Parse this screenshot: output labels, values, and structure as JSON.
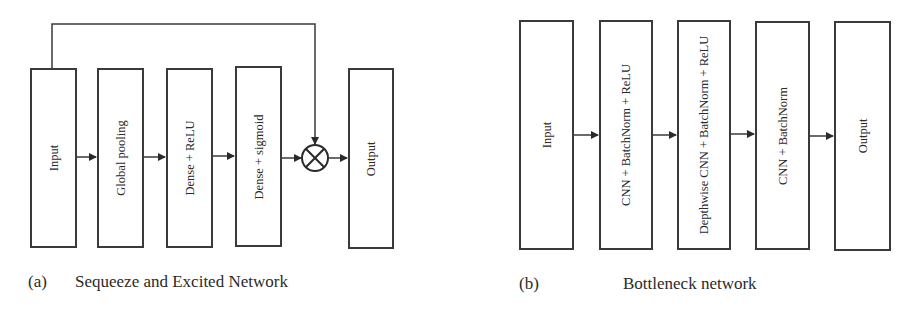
{
  "diagram_a": {
    "caption_tag": "(a)",
    "caption": "Sequeeze and Excited Network",
    "blocks": [
      {
        "label": "Input"
      },
      {
        "label": "Global pooling"
      },
      {
        "label": "Dense + ReLU"
      },
      {
        "label": "Dense + sigmoid"
      },
      {
        "label": "Output"
      }
    ],
    "operator": "multiply",
    "operator_symbol": "⊗",
    "skip_connection": "Input → multiply"
  },
  "diagram_b": {
    "caption_tag": "(b)",
    "caption": "Bottleneck network",
    "blocks": [
      {
        "label": "Input"
      },
      {
        "label": "CNN + BatchNorm + ReLU"
      },
      {
        "label": "Depthwise CNN + BatchNorm + ReLU"
      },
      {
        "label": "CNN + BatchNorm"
      },
      {
        "label": "Output"
      }
    ]
  }
}
